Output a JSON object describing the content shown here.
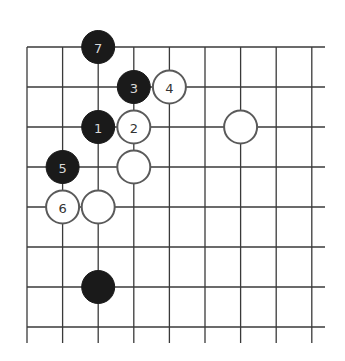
{
  "board": {
    "grid": {
      "origin_x": 27,
      "origin_y": 47,
      "col_spacing": 35.6,
      "row_spacing": 40,
      "columns": 9,
      "rows": 8,
      "right_edge_x": 325,
      "bottom_edge_y": 343,
      "line_color": "#3a3a3a"
    },
    "stone_radius": 16.5,
    "colors": {
      "black_fill": "#1a1a1a",
      "white_fill": "#ffffff",
      "white_outline": "#5a5a5a",
      "label_on_black": "#d8d8d8",
      "label_on_white": "#333333"
    },
    "stones": [
      {
        "color": "black",
        "col": 2,
        "row": 0,
        "label": "7"
      },
      {
        "color": "black",
        "col": 3,
        "row": 1,
        "label": "3"
      },
      {
        "color": "white",
        "col": 4,
        "row": 1,
        "label": "4"
      },
      {
        "color": "black",
        "col": 2,
        "row": 2,
        "label": "1"
      },
      {
        "color": "white",
        "col": 3,
        "row": 2,
        "label": "2"
      },
      {
        "color": "white",
        "col": 6,
        "row": 2,
        "label": ""
      },
      {
        "color": "black",
        "col": 1,
        "row": 3,
        "label": "5"
      },
      {
        "color": "white",
        "col": 3,
        "row": 3,
        "label": ""
      },
      {
        "color": "white",
        "col": 1,
        "row": 4,
        "label": "6"
      },
      {
        "color": "white",
        "col": 2,
        "row": 4,
        "label": ""
      },
      {
        "color": "black",
        "col": 2,
        "row": 6,
        "label": ""
      }
    ]
  }
}
